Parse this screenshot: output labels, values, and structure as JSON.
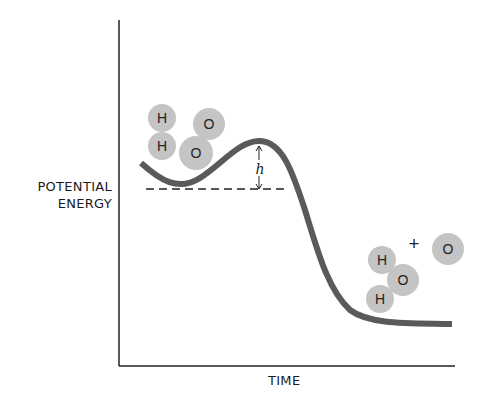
{
  "diagram": {
    "title": "",
    "y_axis_label_line1": "POTENTIAL",
    "y_axis_label_line2": "ENERGY",
    "x_axis_label": "TIME",
    "barrier_label": "h",
    "reactants": {
      "atoms": [
        {
          "symbol": "H",
          "x": 162,
          "y": 118
        },
        {
          "symbol": "H",
          "x": 162,
          "y": 146
        },
        {
          "symbol": "O",
          "x": 209,
          "y": 124
        },
        {
          "symbol": "O",
          "x": 196,
          "y": 153
        }
      ]
    },
    "products": {
      "atoms": [
        {
          "symbol": "H",
          "x": 382,
          "y": 260
        },
        {
          "symbol": "O",
          "x": 402,
          "y": 280
        },
        {
          "symbol": "H",
          "x": 380,
          "y": 299
        },
        {
          "symbol": "O",
          "x": 448,
          "y": 249
        }
      ],
      "plus_sign": "+"
    },
    "colors": {
      "curve": "#5a5a5a",
      "atom_fill": "#c4c4c4",
      "axis": "#222222"
    }
  }
}
